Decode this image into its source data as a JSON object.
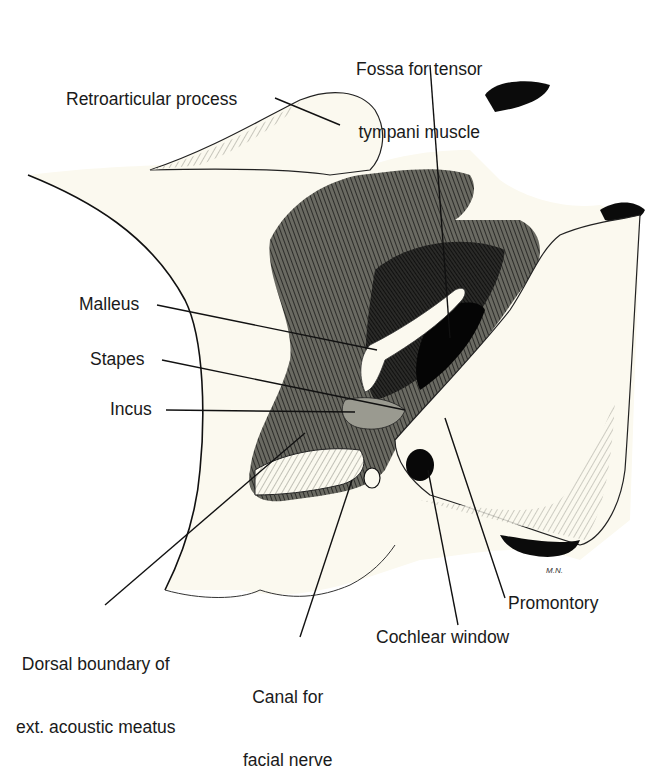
{
  "figure": {
    "signature": "M.N.",
    "colors": {
      "background": "#ffffff",
      "bone": "#fbf9ef",
      "ink": "#111111",
      "shade": "#3a3a36",
      "label": "#1a1a1a"
    }
  },
  "labels": {
    "fossa_tensor_tympani": {
      "line1": "Fossa for tensor",
      "line2": "tympani muscle"
    },
    "retroarticular_process": "Retroarticular process",
    "malleus": "Malleus",
    "stapes": "Stapes",
    "incus": "Incus",
    "dorsal_boundary": {
      "line1": "Dorsal boundary of",
      "line2": "ext. acoustic meatus"
    },
    "canal_facial_nerve": {
      "line1": "Canal for",
      "line2": "facial nerve"
    },
    "cochlear_window": "Cochlear window",
    "promontory": "Promontory"
  }
}
